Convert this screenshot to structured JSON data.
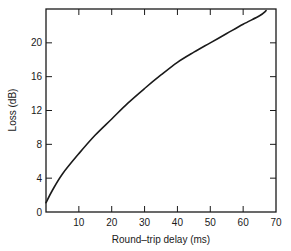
{
  "chart_data": {
    "type": "line",
    "title": "",
    "xlabel": "Round–trip delay (ms)",
    "ylabel": "Loss (dB)",
    "xlim": [
      0,
      70
    ],
    "ylim": [
      0,
      24
    ],
    "x_ticks": [
      10,
      20,
      30,
      40,
      50,
      60,
      70
    ],
    "x_tick_labels": [
      "10",
      "20",
      "30",
      "40",
      "50",
      "60",
      "70"
    ],
    "y_ticks": [
      0,
      4,
      8,
      12,
      16,
      20
    ],
    "y_tick_labels": [
      "0",
      "4",
      "8",
      "12",
      "16",
      "20"
    ],
    "grid": false,
    "legend": null,
    "series": [
      {
        "name": "Loss vs round-trip delay",
        "color": "#1a1a1a",
        "x": [
          0,
          2,
          5,
          10,
          15,
          20,
          25,
          30,
          35,
          40,
          45,
          50,
          55,
          60,
          65,
          67
        ],
        "y": [
          1.1,
          2.6,
          4.5,
          6.9,
          9.1,
          11.0,
          12.9,
          14.6,
          16.2,
          17.7,
          18.9,
          20.0,
          21.1,
          22.2,
          23.2,
          23.8
        ]
      }
    ]
  }
}
